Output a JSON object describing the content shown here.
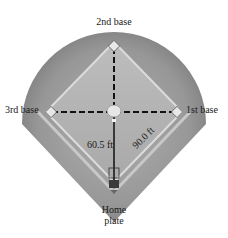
{
  "diagram": {
    "bases": {
      "second": "2nd base",
      "third": "3rd base",
      "first": "1st base",
      "home_line1": "Home",
      "home_line2": "plate"
    },
    "measurements": {
      "pitch_distance": "60.5 ft",
      "base_distance": "90.0 ft"
    },
    "colors": {
      "outfield": "#9a9a9a",
      "outfield_edge": "#7d7d7d",
      "infield": "#b5b5b5",
      "baseline": "#d9d9d9",
      "dash": "#111111",
      "background": "#ffffff"
    }
  }
}
